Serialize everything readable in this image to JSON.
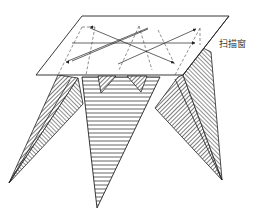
{
  "diagram": {
    "type": "3D illustration of scan window over projected pyramids (spiral CT / sweep-line scanning)",
    "labels": {
      "scan_window": "扫描窗"
    },
    "colors": {
      "stroke": "#222222",
      "hatch_dark": "#555555",
      "hatch_light": "#777777",
      "background": "#ffffff"
    },
    "elements": {
      "scan_window": "parallelogram plane with dashed hidden edges and arrowed scan paths",
      "left_pyramid": "diagonally hatched triangular faces converging to lower-left apex",
      "center_pyramid": "horizontally striped inverted triangle converging to bottom apex",
      "right_pyramid": "diagonally hatched triangular faces converging to lower-right apex",
      "small_notches": "two small hatched inverted triangles at window's lower edge"
    }
  }
}
